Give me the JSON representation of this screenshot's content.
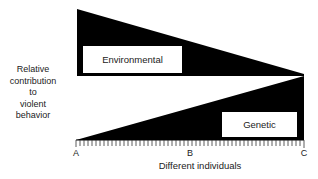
{
  "diagram": {
    "y_axis_label_lines": [
      "Relative",
      "contribution",
      "to",
      "violent",
      "behavior"
    ],
    "x_axis_label": "Different individuals",
    "x_ticks": [
      "A",
      "B",
      "C"
    ],
    "regions": {
      "environmental": {
        "label": "Environmental",
        "shape": "triangle decreasing from A to C",
        "fill": "#000000"
      },
      "genetic": {
        "label": "Genetic",
        "shape": "triangle increasing from A to C",
        "fill": "#000000"
      }
    },
    "colors": {
      "fill": "#000000",
      "background": "#ffffff",
      "label_box": "#ffffff"
    }
  }
}
